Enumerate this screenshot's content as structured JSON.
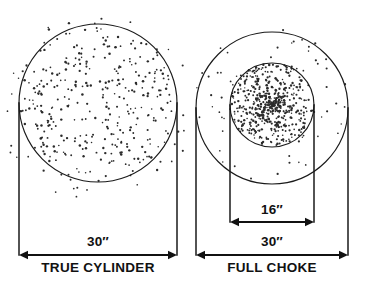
{
  "figure": {
    "background_color": "#ffffff",
    "ink_color": "#111111",
    "panels": [
      {
        "id": "true-cylinder",
        "caption": "TRUE CYLINDER",
        "overall_dimension_label": "30″",
        "core_dimension_label": null,
        "circles": [
          {
            "role": "spread-circle",
            "cx": 98,
            "cy": 103,
            "r": 79,
            "label": "30″"
          }
        ],
        "bracket": {
          "x_left": 19,
          "x_right": 177,
          "y_baseline": 255,
          "y_top": 103
        },
        "dimension_text_position": {
          "x": 98,
          "y": 246
        },
        "caption_position": {
          "x": 98,
          "y": 272
        },
        "pellet_count": 330,
        "pellet_distribution": "even",
        "pellet_scatter_outside": true
      },
      {
        "id": "full-choke",
        "caption": "FULL CHOKE",
        "overall_dimension_label": "30″",
        "core_dimension_label": "16″",
        "circles": [
          {
            "role": "spread-circle",
            "cx": 272,
            "cy": 108,
            "r": 76,
            "label": "30″"
          },
          {
            "role": "core-circle",
            "cx": 272,
            "cy": 105,
            "r": 42,
            "label": "16″"
          }
        ],
        "bracket": {
          "x_left": 196,
          "x_right": 348,
          "y_baseline": 255,
          "y_top": 108
        },
        "core_bracket": {
          "x_left": 230,
          "x_right": 314,
          "y_baseline": 222,
          "y_top": 105
        },
        "dimension_text_position": {
          "x": 272,
          "y": 246
        },
        "core_dimension_text_position": {
          "x": 272,
          "y": 214
        },
        "caption_position": {
          "x": 272,
          "y": 272
        },
        "pellet_count": 430,
        "pellet_distribution": "dense-core",
        "pellet_scatter_outside": true
      }
    ]
  }
}
